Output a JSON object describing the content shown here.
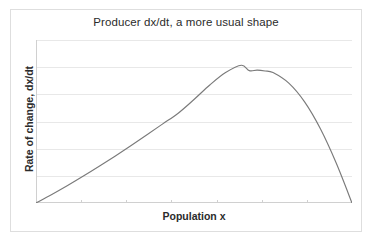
{
  "chart_data": {
    "type": "line",
    "title": "Producer dx/dt, a more usual shape",
    "xlabel": "Population x",
    "ylabel": "Rate of change, dx/dt",
    "grid": "horizontal",
    "legend": "none",
    "xlim": [
      0,
      1
    ],
    "ylim": [
      0,
      1
    ],
    "xticks": [],
    "yticks": [],
    "xtick_labels": [],
    "ytick_labels": [],
    "series": [
      {
        "name": "dx/dt",
        "color": "#7a7a7a",
        "x": [
          0.0,
          0.05,
          0.1,
          0.15,
          0.2,
          0.25,
          0.3,
          0.35,
          0.4,
          0.45,
          0.5,
          0.55,
          0.6,
          0.65,
          0.675,
          0.7,
          0.725,
          0.75,
          0.8,
          0.85,
          0.9,
          0.95,
          1.0
        ],
        "y": [
          0.0,
          0.052,
          0.107,
          0.165,
          0.225,
          0.287,
          0.351,
          0.417,
          0.484,
          0.551,
          0.635,
          0.724,
          0.8,
          0.845,
          0.812,
          0.815,
          0.81,
          0.8,
          0.735,
          0.62,
          0.455,
          0.245,
          0.0
        ]
      }
    ],
    "annotations": [
      {
        "label": "peak",
        "x": 0.675,
        "y": 0.815
      }
    ]
  },
  "axis_titles": {
    "x": "Population x",
    "y": "Rate of change, dx/dt"
  },
  "header": {
    "title": "Producer dx/dt, a more usual shape"
  },
  "colors": {
    "curve": "#7a7a7a",
    "gridline": "#e8e8e8",
    "axis": "#d0d0d0",
    "frame": "#dedede",
    "text": "#2b2b2b",
    "background": "#ffffff"
  }
}
